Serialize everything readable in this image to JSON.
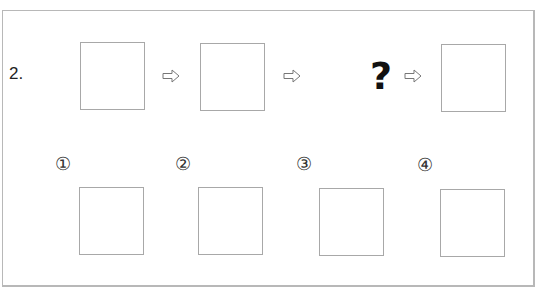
{
  "question": {
    "number": "2.",
    "sequence": [
      {
        "type": "box"
      },
      {
        "type": "arrow",
        "icon": "right-arrow-outline-icon"
      },
      {
        "type": "box"
      },
      {
        "type": "arrow",
        "icon": "right-arrow-outline-icon"
      },
      {
        "type": "unknown",
        "label": "?"
      },
      {
        "type": "arrow",
        "icon": "right-arrow-outline-icon"
      },
      {
        "type": "box"
      }
    ],
    "unknown_label": "?"
  },
  "options": [
    {
      "label": "①"
    },
    {
      "label": "②"
    },
    {
      "label": "③"
    },
    {
      "label": "④"
    }
  ],
  "colors": {
    "border": "#b8b8b8",
    "box_border": "#a8a8a8",
    "text": "#222222"
  }
}
